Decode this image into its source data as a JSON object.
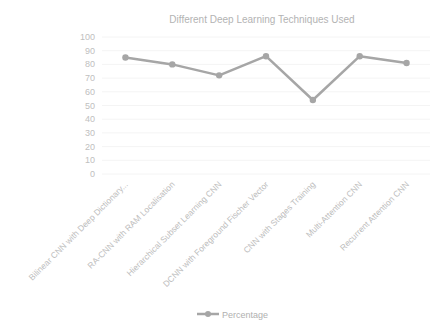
{
  "chart_data": {
    "type": "line",
    "title": "Different Deep Learning Techniques Used",
    "xlabel": "",
    "ylabel": "",
    "categories": [
      "Bilinear CNN with Deep Dictionary...",
      "RA-CNN with RAM Localisation",
      "Hierarchical Subset Learning CNN",
      "DCNN with Foreground Fischer Vector",
      "CNN with Stages Training",
      "Multi-Attention CNN",
      "Recurrent Attention CNN"
    ],
    "series": [
      {
        "name": "Percentage",
        "values": [
          85,
          80,
          72,
          86,
          54,
          86,
          81
        ],
        "color": "#a6a6a6"
      }
    ],
    "ylim": [
      0,
      100
    ],
    "yticks": [
      0,
      10,
      20,
      30,
      40,
      50,
      60,
      70,
      80,
      90,
      100
    ],
    "grid": true,
    "legend_position": "bottom"
  }
}
